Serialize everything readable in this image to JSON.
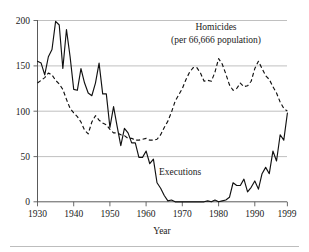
{
  "chart_data": {
    "type": "line",
    "title": "",
    "subtitle": "",
    "xlabel": "Year",
    "ylabel": "",
    "xlim": [
      1930,
      1999
    ],
    "ylim": [
      0,
      200
    ],
    "grid": true,
    "legend_position": "inline-annotation",
    "x_ticks": [
      1930,
      1940,
      1950,
      1960,
      1970,
      1980,
      1990,
      1999
    ],
    "x_tick_labels": [
      "1930",
      "1940",
      "1950",
      "1960",
      "1970",
      "1980",
      "1990",
      "1999"
    ],
    "y_ticks": [
      0,
      50,
      100,
      150,
      200
    ],
    "y_tick_labels": [
      "0",
      "50",
      "100",
      "150",
      "200"
    ],
    "annotations": [
      {
        "name": "homicides-label",
        "line1": "Homicides",
        "line2": "(per 66,666 population)",
        "x": 1974,
        "y": 186
      },
      {
        "name": "executions-label",
        "line1": "Executions",
        "x": 1967,
        "y": 33
      }
    ],
    "x": [
      1930,
      1931,
      1932,
      1933,
      1934,
      1935,
      1936,
      1937,
      1938,
      1939,
      1940,
      1941,
      1942,
      1943,
      1944,
      1945,
      1946,
      1947,
      1948,
      1949,
      1950,
      1951,
      1952,
      1953,
      1954,
      1955,
      1956,
      1957,
      1958,
      1959,
      1960,
      1961,
      1962,
      1963,
      1964,
      1965,
      1966,
      1967,
      1968,
      1969,
      1970,
      1971,
      1972,
      1973,
      1974,
      1975,
      1976,
      1977,
      1978,
      1979,
      1980,
      1981,
      1982,
      1983,
      1984,
      1985,
      1986,
      1987,
      1988,
      1989,
      1990,
      1991,
      1992,
      1993,
      1994,
      1995,
      1996,
      1997,
      1998,
      1999
    ],
    "series": [
      {
        "name": "Executions",
        "style": "solid",
        "values": [
          155,
          153,
          140,
          160,
          168,
          199,
          195,
          147,
          190,
          160,
          124,
          123,
          147,
          131,
          120,
          117,
          131,
          153,
          119,
          119,
          82,
          105,
          83,
          62,
          81,
          76,
          65,
          65,
          49,
          49,
          56,
          42,
          47,
          21,
          15,
          7,
          1,
          2,
          0,
          0,
          0,
          0,
          0,
          0,
          0,
          0,
          0,
          1,
          0,
          2,
          0,
          1,
          2,
          5,
          21,
          18,
          18,
          25,
          11,
          16,
          23,
          14,
          31,
          38,
          31,
          56,
          45,
          74,
          68,
          98
        ]
      },
      {
        "name": "Homicides (per 66,666 population)",
        "style": "dashed",
        "values": [
          131,
          134,
          137,
          142,
          140,
          134,
          130,
          124,
          113,
          103,
          98,
          94,
          88,
          79,
          75,
          88,
          95,
          90,
          87,
          85,
          80,
          76,
          76,
          74,
          73,
          70,
          70,
          68,
          68,
          69,
          70,
          68,
          68,
          69,
          74,
          82,
          89,
          99,
          111,
          118,
          125,
          135,
          143,
          148,
          148,
          142,
          133,
          134,
          133,
          143,
          158,
          152,
          141,
          129,
          123,
          125,
          131,
          127,
          128,
          133,
          147,
          155,
          147,
          139,
          135,
          127,
          120,
          110,
          103,
          100
        ]
      }
    ]
  }
}
